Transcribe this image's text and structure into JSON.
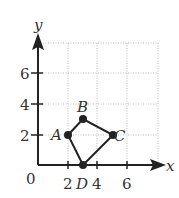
{
  "diagram": {
    "type": "coordinate-plane",
    "axes": {
      "x_label": "x",
      "y_label": "y",
      "origin_label": "0",
      "x_ticks": [
        {
          "value": 2,
          "label": "2"
        },
        {
          "value": 4,
          "label": "4"
        },
        {
          "value": 6,
          "label": "6"
        }
      ],
      "y_ticks": [
        {
          "value": 2,
          "label": "2"
        },
        {
          "value": 4,
          "label": "4"
        },
        {
          "value": 6,
          "label": "6"
        }
      ],
      "grid_range": {
        "x": [
          0,
          8
        ],
        "y": [
          0,
          8
        ]
      },
      "grid_style": "dotted"
    },
    "points": [
      {
        "name": "A",
        "x": 2,
        "y": 2,
        "label": "A"
      },
      {
        "name": "B",
        "x": 3,
        "y": 3,
        "label": "B"
      },
      {
        "name": "C",
        "x": 5,
        "y": 2,
        "label": "C"
      },
      {
        "name": "D",
        "x": 3,
        "y": 0,
        "label": "D"
      }
    ],
    "polygon": [
      "A",
      "B",
      "C",
      "D"
    ],
    "colors": {
      "stroke": "#222222",
      "grid": "#bbbbbb",
      "text": "#333333"
    }
  }
}
